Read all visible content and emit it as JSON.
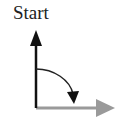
{
  "diagram": {
    "label": "Start",
    "colors": {
      "vertical_arrow": "#111111",
      "horizontal_arrow": "#9a9a9a",
      "rotation_arrow": "#222222",
      "text": "#222222"
    },
    "elements": [
      {
        "type": "arrow",
        "direction": "up",
        "color": "black"
      },
      {
        "type": "arrow",
        "direction": "right",
        "color": "gray"
      },
      {
        "type": "curved-arrow",
        "direction": "clockwise",
        "from": "up",
        "to": "right"
      }
    ]
  }
}
